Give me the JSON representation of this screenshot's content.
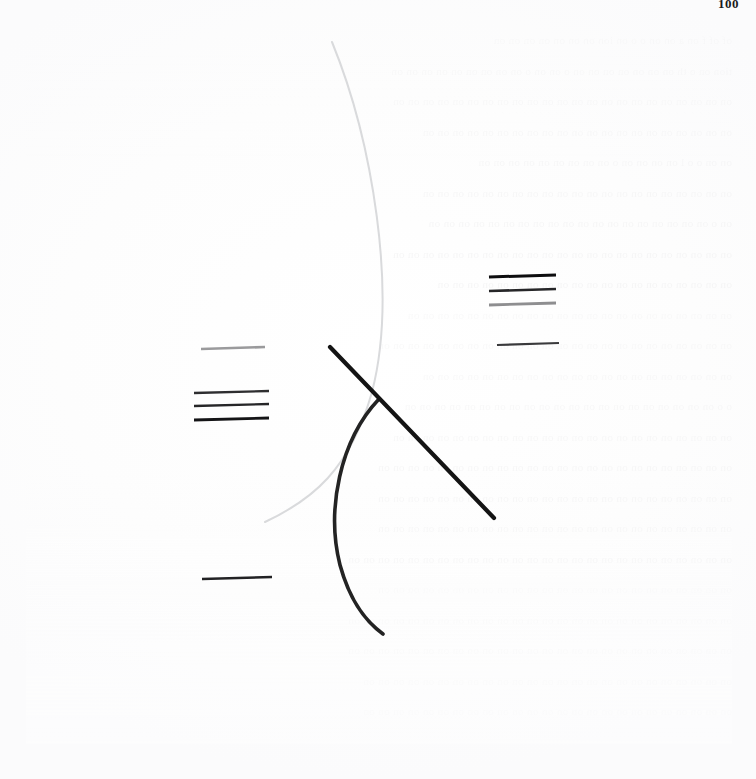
{
  "page": {
    "width": 756,
    "height": 779,
    "page_number": "100",
    "background_color": "#ffffff",
    "paper_tone": "#fdfdfd",
    "bleed_through_color": "#ececed",
    "bleed_through_text": [
      "of   of      f      on      a      on on o   o  on ion  on    on   on on on  on on",
      "tion on o   th  on on on  on   on  on on o   on  on o  on on on on on  on on on on",
      "on on on  on   on on  on   on   on on on  on on  on   on on  on  on on on on on on",
      "on on  on   on   on   on   on   on   on    on  on on on on on  on   on on on on on",
      "on on    o     o      l      on  on  on    on o    on  on  on on on on on  on  on",
      "on on   on   on    on  on   on    on  on  on  on on on on on on   on on on on on",
      "on  o    on  on  on on  on   on on on on  on   on    on on  on on  on  on  on  on",
      "on on   on   on   on  on   on on on on on on on on  on on  on on on  on on on on",
      "on  on   on   on   on  on   on   on on    on   on  on on on  on  on   on on  on on",
      "on   on    on on on on  on  on  on    on on on  on  on on  on on on  on  on on on",
      "on  on    on on on on  on on on on  on on   on on on on  on on on on  on on  on on",
      "on   on     on on on  on  on  on  on  on  on  on on   on  on on  on  on on on  on",
      "o      o   on on  on  on on on  on on on on  on on  on  on on on on  on on on on",
      "on  on   on  on  on  on  on  on  on on on on  on  on on on  on on on  on on  on on",
      "on  on on on on  on on on  on on on  on  on  on on on  on  on  on  on on on  on on",
      "on on on on  on  on on  on  on on on on  on  on on on on on  on on on  on  on  on",
      "on on on on  on on on on on on  on on on  on  on on on  on   on  on  on on on on",
      "on on on on on  on on  on on on on  on on on on on  on on on on  on on on on on on",
      "on on  on  on  on on on on on  on on on  on on on on  on  on on on  on  on on on",
      "on  on on on on  on on on on  on on on on on on on  on  on on on on on on on on on",
      "on on on on on  on on on on on on  on on on on  on on on on on on on  on on on on",
      "on  on on  on on on on on  on on on  on on on on  on on  on on on on on on on on",
      "on on on on  on on on on on on  on  on on on  on on on on on on  on on on on on"
    ]
  },
  "figure": {
    "name": "abstract-line-figure",
    "elements": [
      {
        "id": "light-arc",
        "type": "arc",
        "label": "light-gray-long-arc",
        "color": "#d9dadc",
        "stroke_width": 2.0,
        "path": "M 332 42 C 372 140, 398 292, 372 392 C 350 470, 312 500, 265 522"
      },
      {
        "id": "dark-arc",
        "type": "arc",
        "label": "dark-short-arc",
        "color": "#232323",
        "stroke_width": 3.6,
        "path": "M 379 399 C 340 440, 326 510, 340 565 C 351 605, 368 623, 383 634"
      },
      {
        "id": "diagonal",
        "type": "line",
        "label": "dark-diagonal-segment",
        "color": "#141414",
        "stroke_width": 4.2,
        "x1": 330,
        "y1": 347,
        "x2": 494,
        "y2": 518
      }
    ],
    "rule_groups": [
      {
        "id": "left-group",
        "label": "left-horizontal-rule-group",
        "rules": [
          {
            "id": "left-rule-1",
            "x1": 201,
            "y1": 349,
            "x2": 265,
            "y2": 347,
            "color": "#9a9a9c",
            "stroke_width": 2.6
          },
          {
            "id": "left-rule-2",
            "x1": 194,
            "y1": 393,
            "x2": 269,
            "y2": 391,
            "color": "#2e2e30",
            "stroke_width": 2.4
          },
          {
            "id": "left-rule-3",
            "x1": 194,
            "y1": 406,
            "x2": 269,
            "y2": 404,
            "color": "#262628",
            "stroke_width": 2.4
          },
          {
            "id": "left-rule-4",
            "x1": 194,
            "y1": 420,
            "x2": 269,
            "y2": 418,
            "color": "#141416",
            "stroke_width": 2.8
          }
        ]
      },
      {
        "id": "right-group",
        "label": "right-horizontal-rule-group",
        "rules": [
          {
            "id": "right-rule-1",
            "x1": 489,
            "y1": 277,
            "x2": 556,
            "y2": 275,
            "color": "#0d0d0f",
            "stroke_width": 3.0
          },
          {
            "id": "right-rule-2",
            "x1": 489,
            "y1": 291,
            "x2": 556,
            "y2": 289,
            "color": "#262628",
            "stroke_width": 2.6
          },
          {
            "id": "right-rule-3",
            "x1": 489,
            "y1": 305,
            "x2": 556,
            "y2": 303,
            "color": "#8e8e90",
            "stroke_width": 2.8
          },
          {
            "id": "right-rule-4",
            "x1": 497,
            "y1": 345,
            "x2": 559,
            "y2": 343,
            "color": "#3a3a3c",
            "stroke_width": 2.2
          }
        ]
      },
      {
        "id": "lower-left-group",
        "label": "lower-left-single-rule",
        "rules": [
          {
            "id": "lower-rule-1",
            "x1": 202,
            "y1": 579,
            "x2": 272,
            "y2": 577,
            "color": "#222224",
            "stroke_width": 2.4
          }
        ]
      }
    ]
  }
}
